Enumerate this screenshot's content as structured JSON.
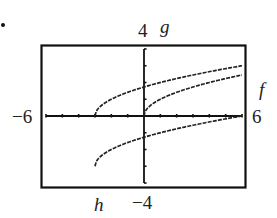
{
  "labels": {
    "ymax": "4",
    "ymin": "−4",
    "xmin": "−6",
    "xmax": "6",
    "curve_g": "g",
    "curve_f": "f",
    "curve_h": "h"
  },
  "chart_data": {
    "type": "line",
    "title": "",
    "xlabel": "",
    "ylabel": "",
    "xlim": [
      -6,
      6
    ],
    "ylim": [
      -4,
      4
    ],
    "xticks_step": 1,
    "yticks_step": 1,
    "grid": false,
    "legend": "curve labels placed next to curves",
    "series": [
      {
        "name": "f",
        "formula": "sqrt(x)",
        "x_start": 0,
        "x_end": 6,
        "points": [
          [
            0,
            0
          ],
          [
            1,
            1
          ],
          [
            2,
            1.41
          ],
          [
            3,
            1.73
          ],
          [
            4,
            2
          ],
          [
            5,
            2.24
          ],
          [
            6,
            2.45
          ]
        ]
      },
      {
        "name": "g",
        "formula": "sqrt(x+3)",
        "x_start": -3,
        "x_end": 6,
        "points": [
          [
            -3,
            0
          ],
          [
            -2,
            1
          ],
          [
            -1,
            1.41
          ],
          [
            0,
            1.73
          ],
          [
            1,
            2
          ],
          [
            2,
            2.24
          ],
          [
            3,
            2.45
          ],
          [
            4,
            2.65
          ],
          [
            5,
            2.83
          ],
          [
            6,
            3
          ]
        ]
      },
      {
        "name": "h",
        "formula": "sqrt(x+3)-3",
        "x_start": -3,
        "x_end": 6,
        "points": [
          [
            -3,
            -3
          ],
          [
            -2,
            -2
          ],
          [
            -1,
            -1.59
          ],
          [
            0,
            -1.27
          ],
          [
            1,
            -1
          ],
          [
            2,
            -0.76
          ],
          [
            3,
            -0.55
          ],
          [
            4,
            -0.35
          ],
          [
            5,
            -0.17
          ],
          [
            6,
            0
          ]
        ]
      }
    ]
  }
}
